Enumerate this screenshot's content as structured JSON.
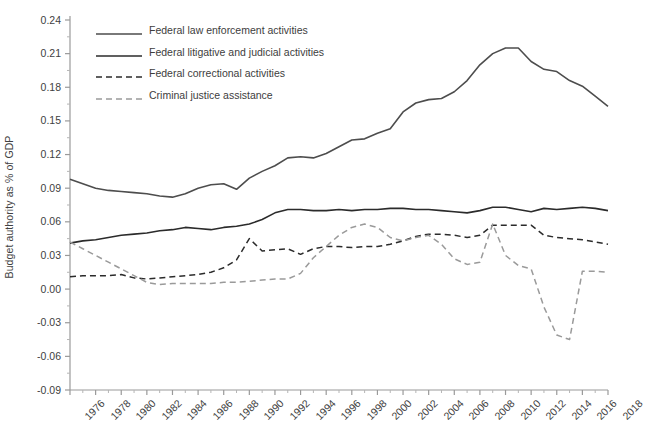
{
  "chart_data": {
    "type": "line",
    "title": "",
    "xlabel": "",
    "ylabel": "Budget authority as % of GDP",
    "xlim": [
      1976,
      2018
    ],
    "ylim": [
      -0.09,
      0.24
    ],
    "grid": false,
    "legend_position": "top-left-inside",
    "ytick_labels": [
      "0.24",
      "0.21",
      "0.18",
      "0.15",
      "0.12",
      "0.09",
      "0.06",
      "0.03",
      "0.00",
      "-0.03",
      "-0.06",
      "-0.09"
    ],
    "ytick_values": [
      0.24,
      0.21,
      0.18,
      0.15,
      0.12,
      0.09,
      0.06,
      0.03,
      0.0,
      -0.03,
      -0.06,
      -0.09
    ],
    "xtick_labels": [
      "1976",
      "1978",
      "1980",
      "1982",
      "1984",
      "1986",
      "1988",
      "1990",
      "1992",
      "1994",
      "1996",
      "1998",
      "2000",
      "2002",
      "2004",
      "2006",
      "2008",
      "2010",
      "2012",
      "2014",
      "2016",
      "2018"
    ],
    "xtick_values": [
      1976,
      1978,
      1980,
      1982,
      1984,
      1986,
      1988,
      1990,
      1992,
      1994,
      1996,
      1998,
      2000,
      2002,
      2004,
      2006,
      2008,
      2010,
      2012,
      2014,
      2016,
      2018
    ],
    "x": [
      1976,
      1977,
      1978,
      1979,
      1980,
      1981,
      1982,
      1983,
      1984,
      1985,
      1986,
      1987,
      1988,
      1989,
      1990,
      1991,
      1992,
      1993,
      1994,
      1995,
      1996,
      1997,
      1998,
      1999,
      2000,
      2001,
      2002,
      2003,
      2004,
      2005,
      2006,
      2007,
      2008,
      2009,
      2010,
      2011,
      2012,
      2013,
      2014,
      2015,
      2016,
      2017,
      2018
    ],
    "series": [
      {
        "name": "Federal law enforcement activities",
        "color": "#4d4d4d",
        "style": "solid",
        "values": [
          0.098,
          0.094,
          0.09,
          0.088,
          0.087,
          0.086,
          0.085,
          0.083,
          0.082,
          0.085,
          0.09,
          0.093,
          0.094,
          0.089,
          0.099,
          0.105,
          0.11,
          0.117,
          0.118,
          0.117,
          0.121,
          0.127,
          0.133,
          0.134,
          0.139,
          0.143,
          0.158,
          0.166,
          0.169,
          0.17,
          0.176,
          0.186,
          0.2,
          0.21,
          0.215,
          0.215,
          0.203,
          0.196,
          0.194,
          0.186,
          0.181,
          0.172,
          0.163
        ]
      },
      {
        "name": "Federal litigative and judicial activities",
        "color": "#2b2b2b",
        "style": "solid",
        "values": [
          0.041,
          0.043,
          0.044,
          0.046,
          0.048,
          0.049,
          0.05,
          0.052,
          0.053,
          0.055,
          0.054,
          0.053,
          0.055,
          0.056,
          0.058,
          0.062,
          0.068,
          0.071,
          0.071,
          0.07,
          0.07,
          0.071,
          0.07,
          0.071,
          0.071,
          0.072,
          0.072,
          0.071,
          0.071,
          0.07,
          0.069,
          0.068,
          0.07,
          0.073,
          0.073,
          0.071,
          0.069,
          0.072,
          0.071,
          0.072,
          0.073,
          0.072,
          0.07
        ]
      },
      {
        "name": "Federal correctional activities",
        "color": "#2b2b2b",
        "style": "dashed",
        "values": [
          0.011,
          0.012,
          0.012,
          0.012,
          0.013,
          0.01,
          0.009,
          0.01,
          0.011,
          0.012,
          0.013,
          0.015,
          0.019,
          0.026,
          0.045,
          0.034,
          0.035,
          0.036,
          0.031,
          0.036,
          0.038,
          0.038,
          0.037,
          0.038,
          0.038,
          0.04,
          0.043,
          0.047,
          0.049,
          0.049,
          0.048,
          0.046,
          0.048,
          0.057,
          0.057,
          0.057,
          0.057,
          0.048,
          0.046,
          0.045,
          0.044,
          0.042,
          0.04
        ]
      },
      {
        "name": "Criminal justice assistance",
        "color": "#9a9a9a",
        "style": "dashed",
        "values": [
          0.042,
          0.036,
          0.03,
          0.024,
          0.018,
          0.012,
          0.006,
          0.004,
          0.005,
          0.005,
          0.005,
          0.005,
          0.006,
          0.006,
          0.007,
          0.008,
          0.009,
          0.009,
          0.014,
          0.028,
          0.038,
          0.048,
          0.055,
          0.058,
          0.055,
          0.046,
          0.043,
          0.046,
          0.048,
          0.04,
          0.027,
          0.022,
          0.024,
          0.058,
          0.03,
          0.021,
          0.018,
          -0.016,
          -0.041,
          -0.045,
          0.016,
          0.016,
          0.015
        ]
      }
    ]
  }
}
